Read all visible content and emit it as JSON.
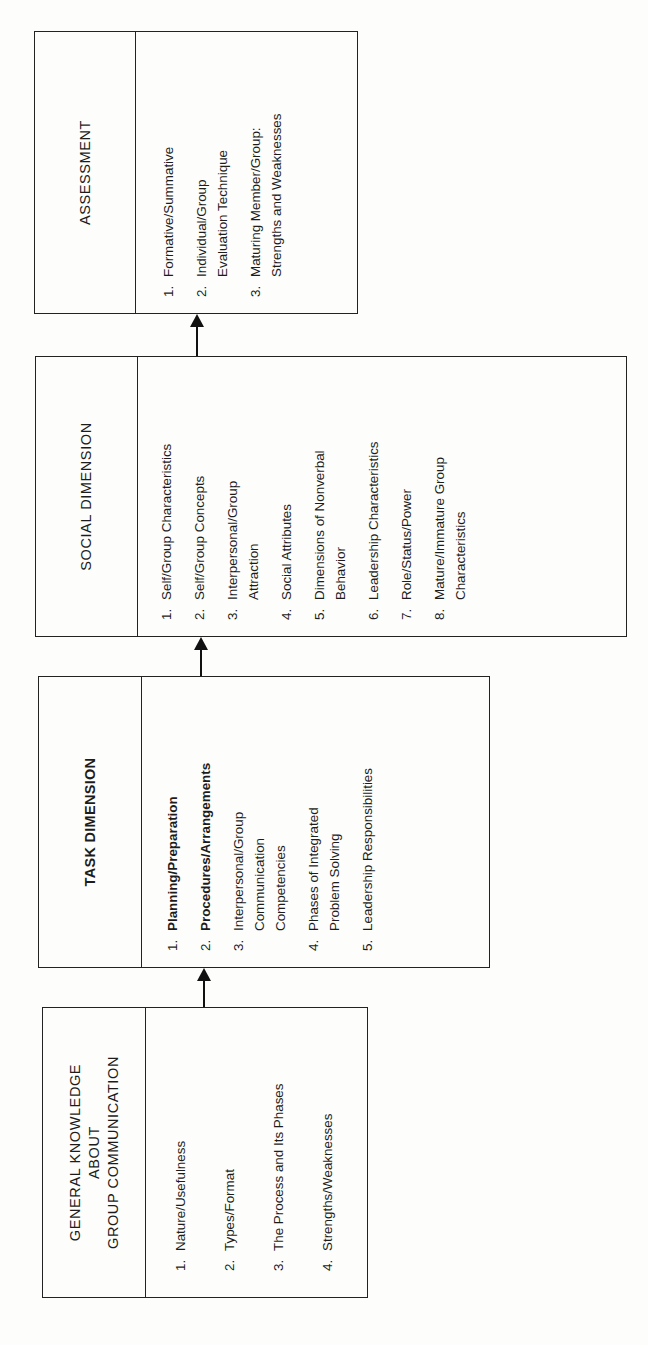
{
  "diagram": {
    "boxes": [
      {
        "id": "assessment",
        "title": "ASSESSMENT",
        "items": [
          {
            "num": "1.",
            "text": "Formative/Summative"
          },
          {
            "num": "2.",
            "text": "Individual/Group\nEvaluation Technique"
          },
          {
            "num": "3.",
            "text": "Maturing Member/Group:\nStrengths and Weaknesses"
          }
        ]
      },
      {
        "id": "social",
        "title": "SOCIAL DIMENSION",
        "items": [
          {
            "num": "1.",
            "text": "Self/Group Characteristics"
          },
          {
            "num": "2.",
            "text": "Self/Group Concepts"
          },
          {
            "num": "3.",
            "text": "Interpersonal/Group\nAttraction"
          },
          {
            "num": "4.",
            "text": "Social Attributes"
          },
          {
            "num": "5.",
            "text": "Dimensions of Nonverbal\nBehavior"
          },
          {
            "num": "6.",
            "text": "Leadership Characteristics"
          },
          {
            "num": "7.",
            "text": "Role/Status/Power"
          },
          {
            "num": "8.",
            "text": "Mature/Immature Group\nCharacteristics"
          }
        ]
      },
      {
        "id": "task",
        "title": "TASK DIMENSION",
        "items": [
          {
            "num": "1.",
            "text": "Planning/Preparation",
            "bold": true
          },
          {
            "num": "2.",
            "text": "Procedures/Arrangements",
            "bold": true
          },
          {
            "num": "3.",
            "text": "Interpersonal/Group\nCommunication\nCompetencies"
          },
          {
            "num": "4.",
            "text": "Phases of Integrated\nProblem Solving"
          },
          {
            "num": "5.",
            "text": "Leadership Responsibilities"
          }
        ]
      },
      {
        "id": "general",
        "title": "GENERAL KNOWLEDGE\nABOUT\nGROUP COMMUNICATION",
        "items": [
          {
            "num": "1.",
            "text": "Nature/Usefulness"
          },
          {
            "num": "2.",
            "text": "Types/Format"
          },
          {
            "num": "3.",
            "text": "The Process and Its Phases"
          },
          {
            "num": "4.",
            "text": "Strengths/Weaknesses"
          }
        ]
      }
    ],
    "flow": [
      "general",
      "task",
      "social",
      "assessment"
    ],
    "orientation": "rotated -90deg (reads bottom-to-top)"
  }
}
